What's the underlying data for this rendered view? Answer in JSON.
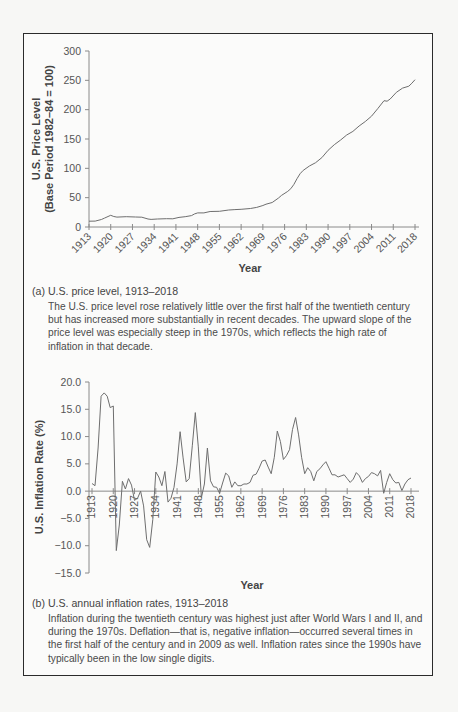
{
  "panel_a": {
    "caption_title": "(a) U.S. price level, 1913–2018",
    "caption_body": "The U.S. price level rose relatively little over the first half of the twentieth century but has increased more substantially in recent decades. The upward slope of the price level was especially steep in the 1970s, which reflects the high rate of inflation in that decade."
  },
  "panel_b": {
    "caption_title": "(b) U.S. annual inflation rates, 1913–2018",
    "caption_body": "Inflation during the twentieth century was highest just after World Wars I and II, and during the 1970s. Deflation—that is, negative inflation—occurred several times in the first half of the century and in 2009 as well. Inflation rates since the 1990s have typically been in the low single digits."
  },
  "chart_data": [
    {
      "type": "line",
      "title": "(a) U.S. price level, 1913–2018",
      "xlabel": "Year",
      "ylabel": "U.S. Price Level (Base Period 1982–84 = 100)",
      "ylabel_lines": [
        "U.S. Price Level",
        "(Base Period 1982–84 = 100)"
      ],
      "xlim": [
        1913,
        2018
      ],
      "ylim": [
        0,
        300
      ],
      "yticks": [
        0,
        50,
        100,
        150,
        200,
        250,
        300
      ],
      "xticks": [
        1913,
        1920,
        1927,
        1934,
        1941,
        1948,
        1955,
        1962,
        1969,
        1976,
        1983,
        1990,
        1997,
        2004,
        2011,
        2018
      ],
      "grid": false,
      "legend": null,
      "series": [
        {
          "name": "CPI",
          "x": [
            1913,
            1915,
            1917,
            1918,
            1920,
            1921,
            1922,
            1925,
            1928,
            1930,
            1932,
            1933,
            1935,
            1938,
            1940,
            1942,
            1944,
            1946,
            1947,
            1948,
            1950,
            1952,
            1955,
            1958,
            1960,
            1962,
            1965,
            1967,
            1969,
            1970,
            1972,
            1974,
            1975,
            1977,
            1978,
            1979,
            1980,
            1981,
            1982,
            1984,
            1986,
            1988,
            1990,
            1992,
            1994,
            1996,
            1998,
            2000,
            2002,
            2004,
            2006,
            2008,
            2009,
            2010,
            2012,
            2014,
            2016,
            2017,
            2018
          ],
          "values": [
            9.9,
            10.1,
            12.8,
            15.1,
            20.0,
            17.9,
            16.8,
            17.5,
            17.1,
            16.7,
            13.7,
            13.0,
            13.7,
            14.1,
            14.0,
            16.3,
            17.6,
            19.5,
            22.3,
            24.1,
            24.1,
            26.5,
            26.8,
            28.9,
            29.6,
            30.2,
            31.5,
            33.4,
            36.7,
            38.8,
            41.8,
            49.3,
            53.8,
            60.6,
            65.2,
            72.6,
            82.4,
            90.9,
            96.5,
            103.9,
            109.6,
            118.3,
            130.7,
            140.3,
            148.2,
            156.9,
            163.0,
            172.2,
            179.9,
            188.9,
            201.6,
            215.3,
            214.5,
            218.1,
            229.6,
            236.7,
            240.0,
            245.1,
            251.1
          ]
        }
      ]
    },
    {
      "type": "line",
      "title": "(b) U.S. annual inflation rates, 1913–2018",
      "xlabel": "Year",
      "ylabel": "U.S. Inflation Rate (%)",
      "xlim": [
        1913,
        2018
      ],
      "ylim": [
        -15,
        20
      ],
      "yticks": [
        -15.0,
        -10.0,
        -5.0,
        0.0,
        5.0,
        10.0,
        15.0,
        20.0
      ],
      "ytick_labels": [
        "−15.0",
        "−10.0",
        "−5.0",
        "0.0",
        "5.0",
        "10.0",
        "15.0",
        "20.0"
      ],
      "xticks": [
        1913,
        1920,
        1927,
        1934,
        1941,
        1948,
        1955,
        1962,
        1969,
        1976,
        1983,
        1990,
        1997,
        2004,
        2011,
        2018
      ],
      "grid": false,
      "legend": null,
      "series": [
        {
          "name": "Inflation rate",
          "x": [
            1913,
            1914,
            1915,
            1916,
            1917,
            1918,
            1919,
            1920,
            1921,
            1922,
            1923,
            1924,
            1925,
            1926,
            1927,
            1928,
            1929,
            1930,
            1931,
            1932,
            1933,
            1934,
            1935,
            1936,
            1937,
            1938,
            1939,
            1940,
            1941,
            1942,
            1943,
            1944,
            1945,
            1946,
            1947,
            1948,
            1949,
            1950,
            1951,
            1952,
            1953,
            1954,
            1955,
            1956,
            1957,
            1958,
            1959,
            1960,
            1961,
            1962,
            1963,
            1964,
            1965,
            1966,
            1967,
            1968,
            1969,
            1970,
            1971,
            1972,
            1973,
            1974,
            1975,
            1976,
            1977,
            1978,
            1979,
            1980,
            1981,
            1982,
            1983,
            1984,
            1985,
            1986,
            1987,
            1988,
            1989,
            1990,
            1991,
            1992,
            1993,
            1994,
            1995,
            1996,
            1997,
            1998,
            1999,
            2000,
            2001,
            2002,
            2003,
            2004,
            2005,
            2006,
            2007,
            2008,
            2009,
            2010,
            2011,
            2012,
            2013,
            2014,
            2015,
            2016,
            2017,
            2018
          ],
          "values": [
            1.4,
            1.0,
            7.9,
            17.4,
            18.0,
            17.4,
            15.3,
            15.6,
            -10.9,
            -6.2,
            1.8,
            0.4,
            2.3,
            1.1,
            -1.7,
            -1.3,
            0.0,
            -2.7,
            -8.9,
            -10.3,
            -5.2,
            3.5,
            2.6,
            1.0,
            3.6,
            -2.0,
            -1.3,
            0.7,
            5.0,
            10.9,
            6.1,
            1.7,
            2.3,
            8.3,
            14.4,
            8.1,
            -1.2,
            1.3,
            7.9,
            1.9,
            0.8,
            0.7,
            -0.4,
            1.5,
            3.3,
            2.8,
            0.7,
            1.7,
            1.0,
            1.0,
            1.3,
            1.3,
            1.6,
            2.9,
            3.1,
            4.2,
            5.5,
            5.7,
            4.4,
            3.2,
            6.2,
            11.0,
            9.1,
            5.8,
            6.5,
            7.6,
            11.3,
            13.5,
            10.3,
            6.2,
            3.2,
            4.3,
            3.6,
            1.9,
            3.6,
            4.1,
            4.8,
            5.4,
            4.2,
            3.0,
            3.0,
            2.6,
            2.8,
            3.0,
            2.3,
            1.6,
            2.2,
            3.4,
            2.8,
            1.6,
            2.3,
            2.7,
            3.4,
            3.2,
            2.8,
            3.8,
            -0.4,
            1.6,
            3.2,
            2.1,
            1.5,
            1.6,
            0.1,
            1.3,
            2.1,
            2.4
          ]
        }
      ]
    }
  ],
  "colors": {
    "line": "#6e6e6e",
    "axis": "#8a8a8a",
    "frame": "#2b2b2b",
    "text": "#444444"
  }
}
